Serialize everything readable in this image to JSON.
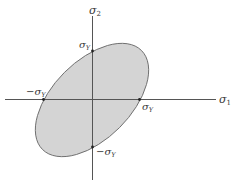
{
  "diagram": {
    "type": "yield-locus",
    "axes": {
      "x_label": "σ",
      "x_label_sub": "1",
      "y_label": "σ",
      "y_label_sub": "2"
    },
    "intercepts": {
      "top": {
        "text": "σ",
        "sub": "Y"
      },
      "bottom": {
        "text": "−σ",
        "sub": "Y"
      },
      "left": {
        "text": "−σ",
        "sub": "Y"
      },
      "right": {
        "text": "σ",
        "sub": "Y"
      }
    },
    "colors": {
      "fill": "#d4d4d4",
      "stroke": "#666666",
      "axis": "#555555",
      "point": "#222222"
    }
  }
}
